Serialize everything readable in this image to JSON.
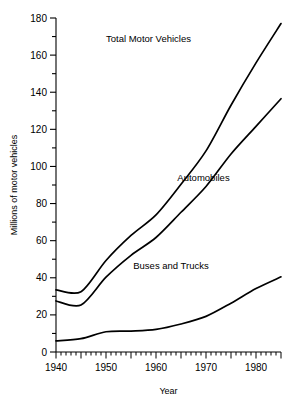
{
  "chart_data": {
    "type": "line",
    "title": "",
    "xlabel": "Year",
    "ylabel": "Millions of motor vehicles",
    "xlim": [
      1940,
      1985
    ],
    "ylim": [
      0,
      180
    ],
    "grid": false,
    "legend_position": "inline-annotations",
    "x_major_ticks": [
      1940,
      1950,
      1960,
      1970,
      1980
    ],
    "x_tick_labels": [
      "1940",
      "1950",
      "1960",
      "1970",
      "1980"
    ],
    "x_minor_tick_interval": 1,
    "x_major_tick_interval": 5,
    "y_major_ticks": [
      0,
      20,
      40,
      60,
      80,
      100,
      120,
      140,
      160,
      180
    ],
    "y_tick_labels": [
      "0",
      "20",
      "40",
      "60",
      "80",
      "100",
      "120",
      "140",
      "160",
      "180"
    ],
    "y_minor_tick_interval": 10,
    "line_color": "#000000",
    "background_color": "#ffffff",
    "series": [
      {
        "name": "Total Motor Vehicles",
        "label_x": 1958.5,
        "label_y": 167,
        "x": [
          1940,
          1945,
          1950,
          1955,
          1960,
          1965,
          1970,
          1975,
          1980,
          1985
        ],
        "values": [
          33.5,
          32.5,
          49.3,
          62.8,
          73.9,
          90.4,
          108.4,
          133.0,
          155.8,
          177.0
        ]
      },
      {
        "name": "Automobiles",
        "label_x": 1969.5,
        "label_y": 92,
        "x": [
          1940,
          1945,
          1950,
          1955,
          1960,
          1965,
          1970,
          1975,
          1980,
          1985
        ],
        "values": [
          27.5,
          25.3,
          40.3,
          52.1,
          61.7,
          75.3,
          89.2,
          106.7,
          121.6,
          136.5
        ]
      },
      {
        "name": "Buses and Trucks",
        "label_x": 1963.0,
        "label_y": 45,
        "x": [
          1940,
          1945,
          1950,
          1955,
          1960,
          1965,
          1970,
          1975,
          1980,
          1985
        ],
        "values": [
          6.0,
          7.2,
          10.9,
          11.3,
          12.2,
          15.1,
          19.2,
          26.3,
          34.2,
          40.5
        ]
      }
    ]
  }
}
